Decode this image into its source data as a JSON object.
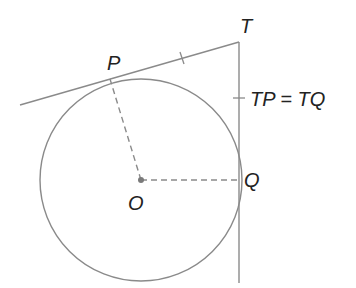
{
  "diagram": {
    "colors": {
      "line": "#8a8a8a",
      "text": "#222222",
      "center_dot": "#7a7a7a"
    },
    "labels": {
      "P": "P",
      "T": "T",
      "O": "O",
      "Q": "Q",
      "equation": "TP = TQ"
    },
    "points": {
      "O": [
        141,
        180
      ],
      "P": [
        110,
        79
      ],
      "Q": [
        239,
        180
      ],
      "T": [
        239,
        42
      ]
    },
    "circle": {
      "center": "O",
      "radius": 101
    },
    "segments": [
      {
        "name": "tangent-TP",
        "from": [
          20,
          105
        ],
        "to": [
          239,
          42
        ],
        "style": "solid"
      },
      {
        "name": "tangent-TQ",
        "from": [
          239,
          42
        ],
        "to": [
          239,
          283
        ],
        "style": "solid"
      },
      {
        "name": "radius-OP",
        "from": [
          141,
          180
        ],
        "to": [
          110,
          79
        ],
        "style": "dashed"
      },
      {
        "name": "radius-OQ",
        "from": [
          141,
          180
        ],
        "to": [
          239,
          180
        ],
        "style": "dashed"
      }
    ]
  }
}
